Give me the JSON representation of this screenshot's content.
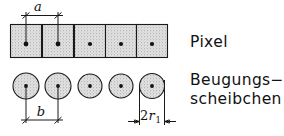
{
  "figure": {
    "background_color": "#ffffff",
    "line_color": "#1a1a1a",
    "fill_color": "#d9d9d9",
    "labels": {
      "pixel": "Pixel",
      "beugungs_line1": "Beugungs−",
      "beugungs_line2": "scheibchen"
    },
    "dimensions": {
      "a": "a",
      "b": "b",
      "two_r": "2",
      "two_r_var": "r",
      "two_r_sub": "1"
    },
    "rows": [
      {
        "name": "pixel-row",
        "shape": "square",
        "count": 5,
        "label": "Pixel",
        "dimension": "a",
        "dimension_meaning": "pixel pitch (center to center)"
      },
      {
        "name": "airy-disk-row",
        "shape": "circle",
        "count": 5,
        "label": "Beugungsscheibchen",
        "dimension": "b",
        "dimension_meaning": "disk spacing (center to center)",
        "dimension2": "2r1",
        "dimension2_meaning": "disk diameter"
      }
    ]
  }
}
